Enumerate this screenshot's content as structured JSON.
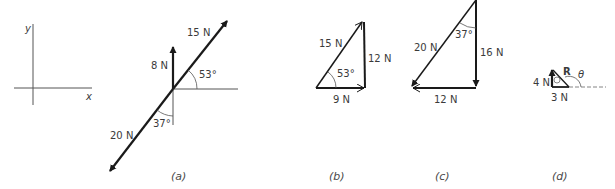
{
  "axes": {
    "x_label": "x",
    "y_label": "y"
  },
  "panel_a": {
    "caption": "(a)",
    "force_15": "15 N",
    "force_8": "8 N",
    "force_20": "20 N",
    "angle_53": "53°",
    "angle_37": "37°"
  },
  "panel_b": {
    "caption": "(b)",
    "hyp": "15 N",
    "vertical": "12 N",
    "horizontal": "9 N",
    "angle": "53°"
  },
  "panel_c": {
    "caption": "(c)",
    "hyp": "20 N",
    "vertical": "16 N",
    "horizontal": "12 N",
    "angle": "37°"
  },
  "panel_d": {
    "caption": "(d)",
    "vertical": "4 N",
    "horizontal": "3 N",
    "resultant": "R",
    "theta": "θ",
    "phi": "φ"
  },
  "colors": {
    "line": "#1a1a1a",
    "thin": "#555555",
    "text": "#3a3a3a"
  }
}
